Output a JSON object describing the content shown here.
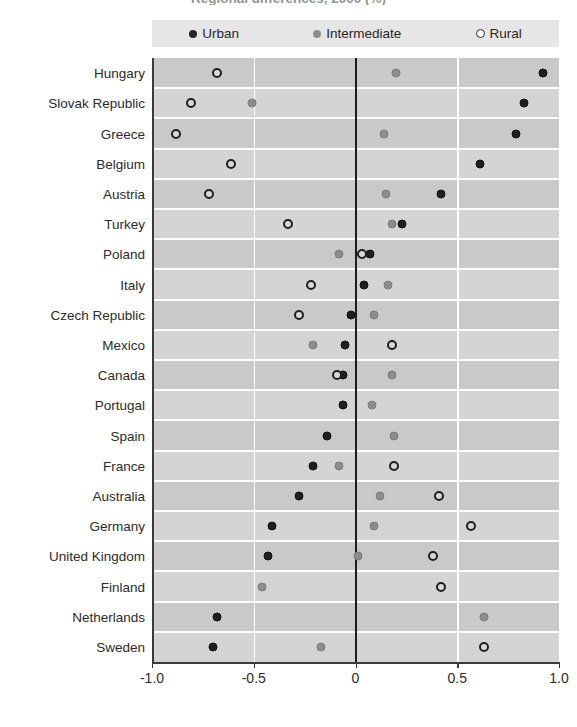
{
  "chart_title": "Regional differences, 2000 (%)",
  "legend": {
    "items": [
      {
        "label": "Urban",
        "marker": "filled-dark-circle-icon",
        "color": "#262626"
      },
      {
        "label": "Intermediate",
        "marker": "filled-gray-circle-icon",
        "color": "#8f8f8f"
      },
      {
        "label": "Rural",
        "marker": "open-circle-icon",
        "color": "#ffffff"
      }
    ]
  },
  "axis": {
    "x_ticks": [
      "-1.0",
      "-0.5",
      "0",
      "0.5",
      "1.0"
    ],
    "x_tick_values": [
      -1.0,
      -0.5,
      0,
      0.5,
      1.0
    ],
    "x_min": -1.0,
    "x_max": 1.0,
    "zero_line": 0
  },
  "chart_data": {
    "type": "scatter",
    "title": "Regional differences, 2000 (%)",
    "xlabel": "",
    "ylabel": "",
    "xlim": [
      -1.0,
      1.0
    ],
    "grid": true,
    "legend_position": "top",
    "categories": [
      "Hungary",
      "Slovak Republic",
      "Greece",
      "Belgium",
      "Austria",
      "Turkey",
      "Poland",
      "Italy",
      "Czech Republic",
      "Mexico",
      "Canada",
      "Portugal",
      "Spain",
      "France",
      "Australia",
      "Germany",
      "United Kingdom",
      "Finland",
      "Netherlands",
      "Sweden"
    ],
    "series": [
      {
        "name": "Urban",
        "values": [
          0.92,
          0.83,
          0.79,
          0.61,
          0.42,
          0.23,
          0.07,
          0.04,
          -0.02,
          -0.05,
          -0.06,
          -0.06,
          -0.14,
          -0.21,
          -0.28,
          -0.41,
          -0.43,
          null,
          -0.68,
          -0.7
        ]
      },
      {
        "name": "Intermediate",
        "values": [
          0.2,
          -0.51,
          0.14,
          null,
          0.15,
          0.18,
          -0.08,
          0.16,
          0.09,
          -0.21,
          0.18,
          0.08,
          0.19,
          -0.08,
          0.12,
          0.09,
          0.01,
          -0.46,
          0.63,
          -0.17
        ]
      },
      {
        "name": "Rural",
        "values": [
          -0.68,
          -0.81,
          -0.88,
          -0.61,
          -0.72,
          -0.33,
          0.03,
          -0.22,
          -0.28,
          0.18,
          -0.09,
          null,
          null,
          0.19,
          0.41,
          0.57,
          0.38,
          0.42,
          null,
          0.63
        ]
      }
    ]
  }
}
